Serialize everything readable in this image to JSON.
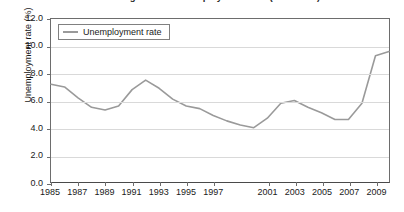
{
  "chart_data": {
    "type": "line",
    "title": "U.S. Average Annual Unemployment Rate (1985-2010)",
    "xlabel": "",
    "ylabel": "Unemployment rate (%)",
    "ylim": [
      0.0,
      12.0
    ],
    "xlim": [
      1985,
      2010
    ],
    "grid": true,
    "legend_position": "top-left",
    "y_ticks": [
      "0.0",
      "2.0",
      "4.0",
      "6.0",
      "8.0",
      "10.0",
      "12.0"
    ],
    "y_tick_values": [
      0.0,
      2.0,
      4.0,
      6.0,
      8.0,
      10.0,
      12.0
    ],
    "x_ticks": [
      "1985",
      "1987",
      "1989",
      "1991",
      "1993",
      "1995",
      "1997",
      "2001",
      "2003",
      "2005",
      "2007",
      "2009"
    ],
    "x_tick_values": [
      1985,
      1987,
      1989,
      1991,
      1993,
      1995,
      1997,
      2001,
      2003,
      2005,
      2007,
      2009
    ],
    "line_color": "#9a9a9a",
    "series": [
      {
        "name": "Unemployment rate",
        "x": [
          1985,
          1986,
          1987,
          1988,
          1989,
          1990,
          1991,
          1992,
          1993,
          1994,
          1995,
          1996,
          1997,
          1998,
          1999,
          2000,
          2001,
          2002,
          2003,
          2004,
          2005,
          2006,
          2007,
          2008,
          2009,
          2010
        ],
        "values": [
          7.2,
          7.0,
          6.2,
          5.5,
          5.3,
          5.6,
          6.8,
          7.5,
          6.9,
          6.1,
          5.6,
          5.4,
          4.9,
          4.5,
          4.2,
          4.0,
          4.7,
          5.8,
          6.0,
          5.5,
          5.1,
          4.6,
          4.6,
          5.8,
          9.3,
          9.6
        ]
      }
    ]
  },
  "legend": {
    "entries": [
      {
        "label": "Unemployment rate",
        "color": "#9a9a9a"
      }
    ]
  }
}
